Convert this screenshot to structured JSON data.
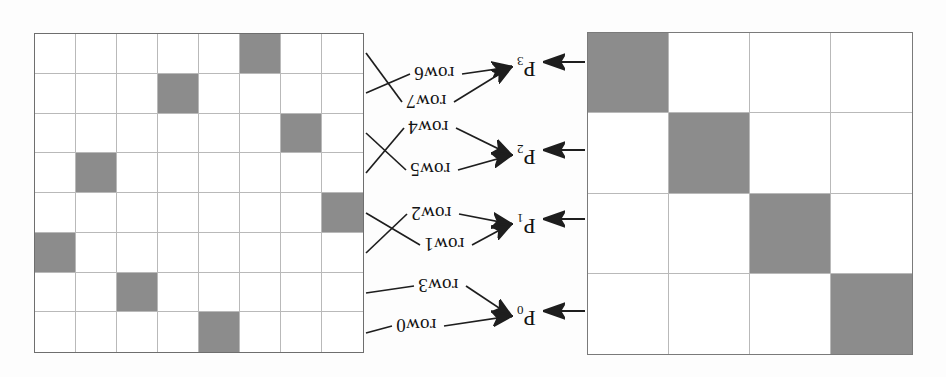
{
  "figure": {
    "orientation": "rotated-180",
    "background_color": "#fdfdfd",
    "shade_color": "#8c8c8c",
    "grid_line_color": "#b9b9b9",
    "border_color": "#6e6e6e",
    "ink_color": "#1e1e1e"
  },
  "left_grid": {
    "name": "memory-bank-grid",
    "rows": 8,
    "cols": 8,
    "shaded_cells": [
      {
        "row": 0,
        "col": 5
      },
      {
        "row": 1,
        "col": 3
      },
      {
        "row": 2,
        "col": 6
      },
      {
        "row": 3,
        "col": 1
      },
      {
        "row": 4,
        "col": 7
      },
      {
        "row": 5,
        "col": 0
      },
      {
        "row": 6,
        "col": 2
      },
      {
        "row": 7,
        "col": 4
      }
    ]
  },
  "right_grid": {
    "name": "processor-grid",
    "rows": 4,
    "cols": 4,
    "shaded_cells": [
      {
        "row": 0,
        "col": 0
      },
      {
        "row": 1,
        "col": 1
      },
      {
        "row": 2,
        "col": 2
      },
      {
        "row": 3,
        "col": 3
      }
    ]
  },
  "row_labels": [
    {
      "id": "row6",
      "text": "row6",
      "x": 414,
      "y": 64,
      "source_grid_row": 1
    },
    {
      "id": "row7",
      "text": "row7",
      "x": 406,
      "y": 92,
      "source_grid_row": 0
    },
    {
      "id": "row4",
      "text": "row4",
      "x": 408,
      "y": 118,
      "source_grid_row": 3
    },
    {
      "id": "row5",
      "text": "row5",
      "x": 410,
      "y": 160,
      "source_grid_row": 2
    },
    {
      "id": "row2",
      "text": "row2",
      "x": 411,
      "y": 204,
      "source_grid_row": 5
    },
    {
      "id": "row1",
      "text": "row1",
      "x": 424,
      "y": 235,
      "source_grid_row": 4
    },
    {
      "id": "row3",
      "text": "row3",
      "x": 418,
      "y": 276,
      "source_grid_row": 6
    },
    {
      "id": "row0",
      "text": "row0",
      "x": 396,
      "y": 316,
      "source_grid_row": 7
    }
  ],
  "processor_labels": [
    {
      "id": "P3",
      "base": "P",
      "sub": "3",
      "x": 517,
      "y": 55,
      "arrow_in_y": 62,
      "grid_row": 0
    },
    {
      "id": "P2",
      "base": "P",
      "sub": "2",
      "x": 517,
      "y": 143,
      "arrow_in_y": 150,
      "grid_row": 1
    },
    {
      "id": "P1",
      "base": "P",
      "sub": "1",
      "x": 517,
      "y": 212,
      "arrow_in_y": 219,
      "grid_row": 2
    },
    {
      "id": "P0",
      "base": "P",
      "sub": "0",
      "x": 517,
      "y": 304,
      "arrow_in_y": 311,
      "grid_row": 3
    }
  ],
  "connectors": [
    {
      "from_row_label": "row6",
      "to_processor": "P3"
    },
    {
      "from_row_label": "row7",
      "to_processor": "P3"
    },
    {
      "from_row_label": "row4",
      "to_processor": "P2"
    },
    {
      "from_row_label": "row5",
      "to_processor": "P2"
    },
    {
      "from_row_label": "row2",
      "to_processor": "P1"
    },
    {
      "from_row_label": "row1",
      "to_processor": "P1"
    },
    {
      "from_row_label": "row3",
      "to_processor": "P0"
    },
    {
      "from_row_label": "row0",
      "to_processor": "P0"
    }
  ]
}
